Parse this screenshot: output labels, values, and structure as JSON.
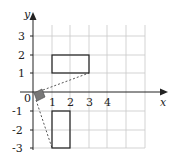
{
  "axes": {
    "x_label": "x",
    "y_label": "y",
    "origin_label": "0",
    "x_ticks": [
      "1",
      "2",
      "3",
      "4"
    ],
    "y_ticks_pos": [
      "3",
      "2",
      "1"
    ],
    "y_ticks_neg": [
      "-1",
      "-2",
      "-3"
    ]
  },
  "shapes": {
    "small_square": {
      "description": "shaded square near origin",
      "fill": "#777777"
    },
    "rectangle_a": {
      "corners": [
        [
          1,
          1
        ],
        [
          3,
          1
        ],
        [
          3,
          2
        ],
        [
          1,
          2
        ]
      ]
    },
    "rectangle_b": {
      "corners": [
        [
          1,
          -1
        ],
        [
          2,
          -1
        ],
        [
          2,
          -3
        ],
        [
          1,
          -3
        ]
      ]
    },
    "dashed_lines": [
      {
        "from": [
          0.5,
          0.1
        ],
        "to": [
          3,
          1
        ]
      },
      {
        "from": [
          0.1,
          -0.4
        ],
        "to": [
          1,
          -3
        ]
      }
    ]
  },
  "colors": {
    "grid": "#c8c8c8",
    "lines": "#222222",
    "shade": "#777777"
  }
}
